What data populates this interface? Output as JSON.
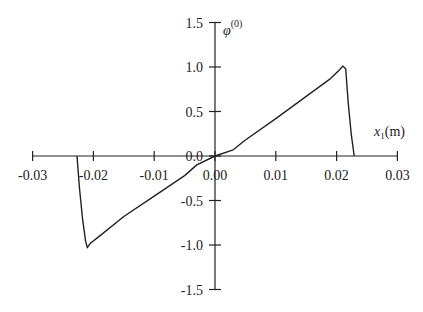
{
  "chart_data": {
    "type": "line",
    "title": "",
    "xlabel": "x 1(m)",
    "ylabel": "φ(0)",
    "xlim": [
      -0.03,
      0.03
    ],
    "ylim": [
      -1.5,
      1.5
    ],
    "grid": false,
    "legend": null,
    "x_ticks": [
      "-0.03",
      "-0.02",
      "-0.01",
      "0.00",
      "0.01",
      "0.02",
      "0.03"
    ],
    "y_ticks": [
      "1.5",
      "1.0",
      "0.5",
      "0.0",
      "-0.5",
      "-1.0",
      "-1.5"
    ],
    "series": [
      {
        "name": "phi0",
        "x": [
          -0.0227,
          -0.0223,
          -0.0218,
          -0.0213,
          -0.021,
          -0.0205,
          -0.019,
          -0.015,
          -0.01,
          -0.005,
          -0.003,
          0.0,
          0.003,
          0.005,
          0.01,
          0.015,
          0.019,
          0.0205,
          0.021,
          0.0215,
          0.0219,
          0.0224,
          0.0229
        ],
        "y": [
          0.0,
          -0.35,
          -0.7,
          -0.95,
          -1.03,
          -0.98,
          -0.9,
          -0.68,
          -0.45,
          -0.22,
          -0.1,
          0.0,
          0.07,
          0.18,
          0.42,
          0.67,
          0.87,
          0.97,
          1.01,
          0.98,
          0.6,
          0.25,
          0.0
        ]
      }
    ]
  },
  "labels": {
    "x_axis_title_main": "x",
    "x_axis_title_sub": "1",
    "x_axis_title_unit": "(m)",
    "y_axis_title_main": "φ",
    "y_axis_title_sup": "(0)"
  }
}
